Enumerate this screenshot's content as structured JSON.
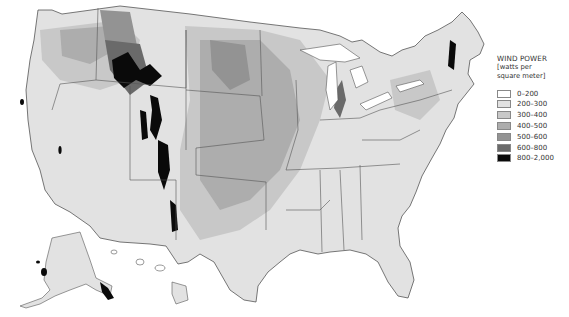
{
  "legend": {
    "title": "WIND POWER",
    "subtitle_line1": "[watts per",
    "subtitle_line2": "square meter]",
    "items": [
      {
        "label": "0–200",
        "color": "#ffffff"
      },
      {
        "label": "200–300",
        "color": "#e2e2e2"
      },
      {
        "label": "300–400",
        "color": "#c8c8c8"
      },
      {
        "label": "400–500",
        "color": "#adadad"
      },
      {
        "label": "500–600",
        "color": "#939393"
      },
      {
        "label": "600–800",
        "color": "#6a6a6a"
      },
      {
        "label": "800–2,000",
        "color": "#0a0a0a"
      }
    ]
  },
  "map": {
    "subject": "United States wind power density",
    "regions_shown": [
      "Contiguous United States",
      "Alaska",
      "Hawaii"
    ]
  }
}
